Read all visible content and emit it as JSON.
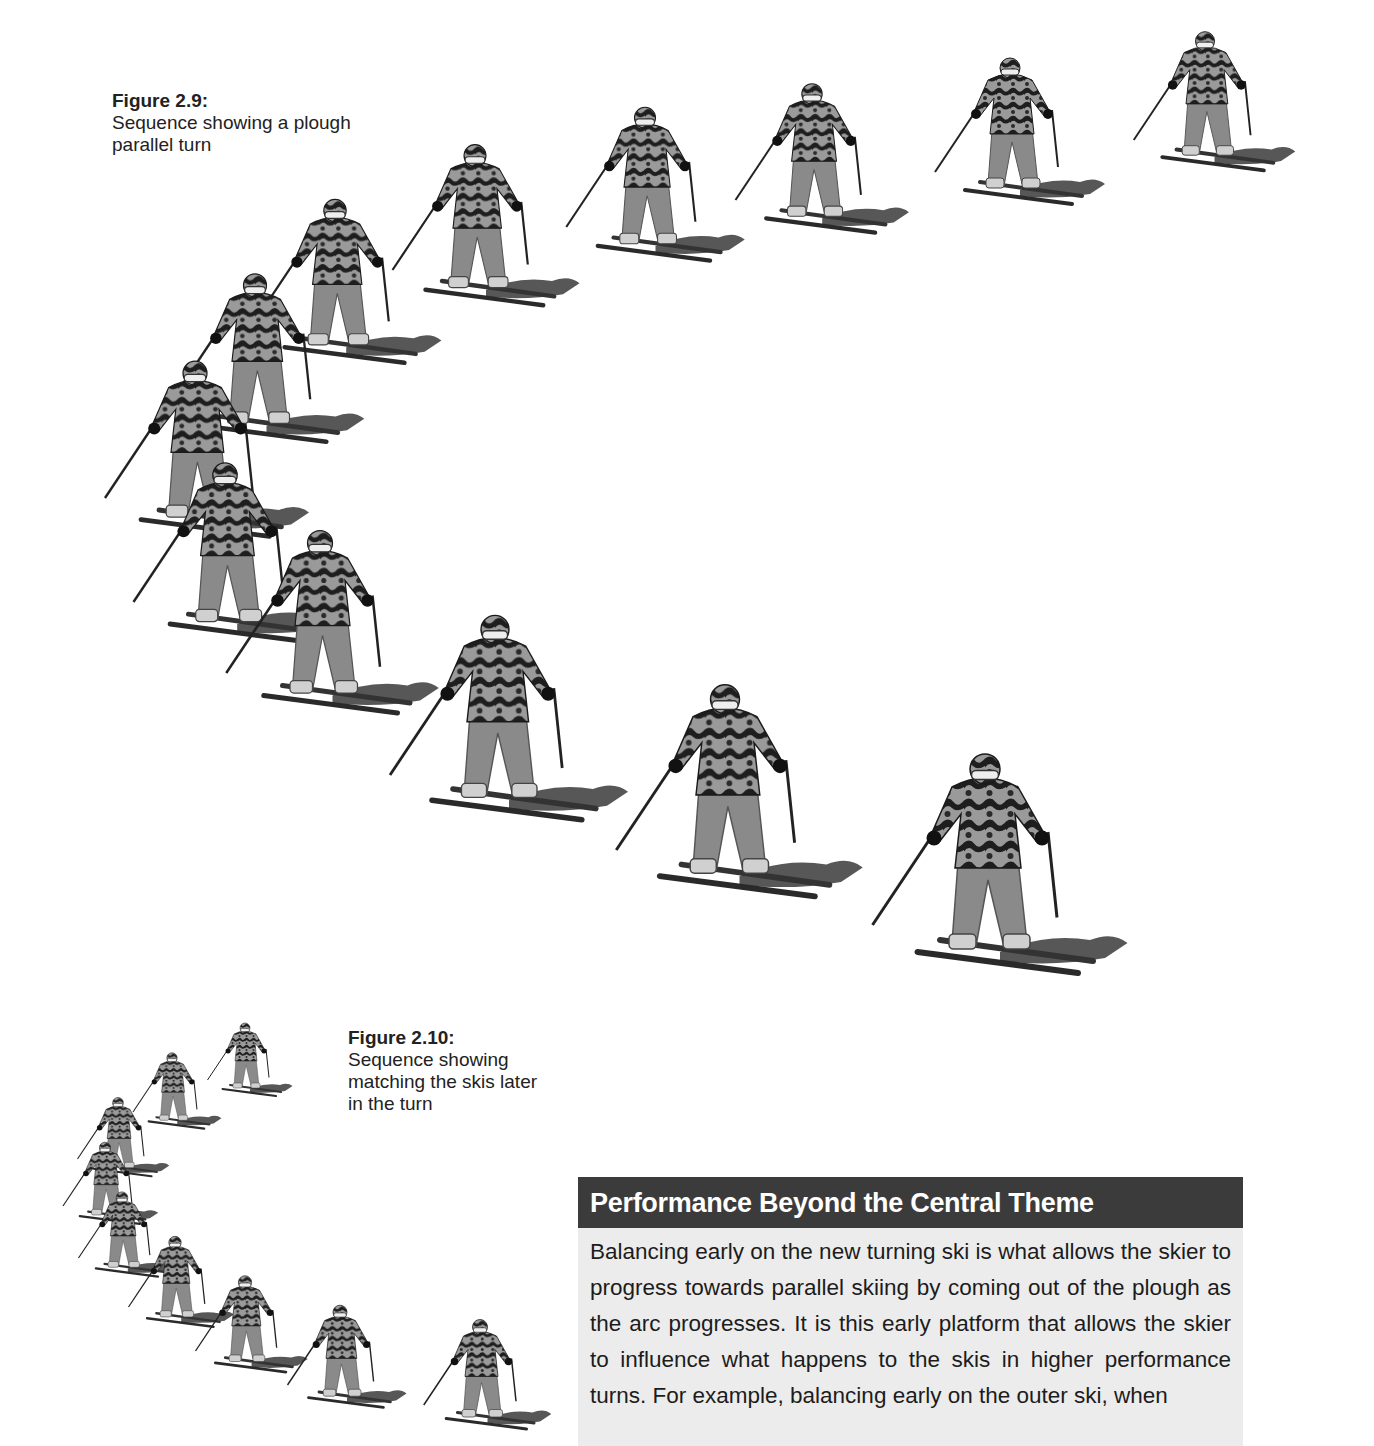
{
  "figures": [
    {
      "id": "figure-2-9",
      "title": "Figure 2.9:",
      "caption": "Sequence showing a plough parallel turn",
      "frames": 13,
      "image_description": "Sequence of skier photos along a curved turn path"
    },
    {
      "id": "figure-2-10",
      "title": "Figure 2.10:",
      "caption": "Sequence showing matching the skis later in the turn",
      "frames": 10,
      "image_description": "Smaller sequence of skier photos along a curved turn path"
    }
  ],
  "sidebar_box": {
    "heading": "Performance Beyond the Central Theme",
    "body": "Balancing early on the new turning ski is what allows the skier to progress towards parallel skiing by coming out of the plough as the arc progresses. It is this early platform that allows the skier to influence what happens to the skis in higher performance turns. For example, balancing early on the outer ski, when",
    "colors": {
      "heading_bg": "#3b3b3b",
      "heading_text": "#ffffff",
      "body_bg": "#ececec"
    }
  }
}
